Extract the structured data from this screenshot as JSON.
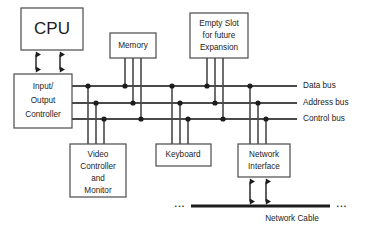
{
  "diagram": {
    "background_color": "#ffffff",
    "line_color": "#4a4a4a",
    "dot_color": "#1c1c1c",
    "text_color": "#1c1c1c"
  },
  "blocks": {
    "cpu": {
      "label": "CPU",
      "x": 21,
      "y": 8,
      "w": 62,
      "h": 42
    },
    "io_controller": {
      "lines": [
        "Input/",
        "Output",
        "Controller"
      ],
      "line1": "Input/",
      "line2": "Output",
      "line3": "Controller",
      "x": 14,
      "y": 74,
      "w": 58,
      "h": 54
    },
    "memory": {
      "label": "Memory",
      "x": 110,
      "y": 33,
      "w": 46,
      "h": 25
    },
    "empty_slot": {
      "line1": "Empty Slot",
      "line2": "for future",
      "line3": "Expansion",
      "x": 190,
      "y": 13,
      "w": 58,
      "h": 45
    },
    "video_controller": {
      "line1": "Video",
      "line2": "Controller",
      "line3": "and",
      "line4": "Monitor",
      "x": 70,
      "y": 144,
      "w": 56,
      "h": 53
    },
    "keyboard": {
      "label": "Keyboard",
      "x": 156,
      "y": 144,
      "w": 55,
      "h": 22
    },
    "network_interface": {
      "line1": "Network",
      "line2": "Interface",
      "x": 238,
      "y": 144,
      "w": 52,
      "h": 33
    }
  },
  "buses": [
    {
      "id": "data-bus",
      "label": "Data bus",
      "y": 86
    },
    {
      "id": "address-bus",
      "label": "Address bus",
      "y": 103
    },
    {
      "id": "control-bus",
      "label": "Control bus",
      "y": 119
    }
  ],
  "bus_geometry": {
    "x_start": 72,
    "x_end": 297,
    "label_x": 303
  },
  "network_cable": {
    "label": "Network Cable",
    "left_ellipsis": "...",
    "right_ellipsis": "...",
    "y": 206,
    "x_start": 191,
    "x_end": 330
  },
  "connections": {
    "cpu_to_io": {
      "type": "double-arrow",
      "count": 2,
      "x_positions": [
        36,
        60
      ],
      "y_top": 50,
      "y_bottom": 74
    },
    "memory_to_bus": {
      "x_positions": [
        125,
        133,
        141
      ],
      "count": 3
    },
    "empty_slot_to_bus": {
      "x_positions": [
        207,
        215,
        223
      ],
      "count": 3
    },
    "video_to_bus": {
      "x_positions": [
        88,
        96,
        104
      ],
      "count": 3
    },
    "keyboard_to_bus": {
      "x_positions": [
        172,
        180,
        188
      ],
      "count": 3
    },
    "network_to_bus": {
      "x_positions": [
        250,
        258,
        266
      ],
      "count": 3
    },
    "io_taps": {
      "x_positions": [
        88,
        96,
        104
      ],
      "count": 3
    },
    "network_to_cable": {
      "type": "double-arrow",
      "count": 2,
      "x_positions": [
        250,
        266
      ],
      "y_top": 177,
      "y_bottom": 206
    }
  }
}
